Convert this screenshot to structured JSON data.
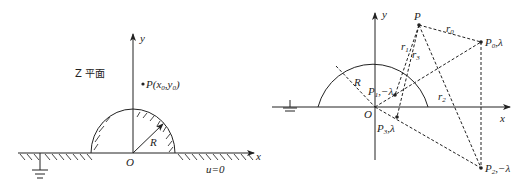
{
  "left_figure": {
    "plane_label": "Z 平面",
    "axis_x": "x",
    "axis_y": "y",
    "origin": "O",
    "radius_label": "R",
    "point_label": "P(x",
    "point_sub_x": "0",
    "point_mid": ",y",
    "point_sub_y": "0",
    "point_close": ")",
    "boundary_label": "u=0"
  },
  "right_figure": {
    "axis_x": "x",
    "axis_y": "y",
    "origin": "O",
    "radius_label": "R",
    "points": [
      {
        "name": "P",
        "sub": "",
        "charge": ""
      },
      {
        "name": "P",
        "sub": "0",
        "charge": ",λ"
      },
      {
        "name": "P",
        "sub": "1",
        "charge": ",−λ"
      },
      {
        "name": "P",
        "sub": "2",
        "charge": ",−λ"
      },
      {
        "name": "P",
        "sub": "3",
        "charge": ",λ"
      }
    ],
    "distances": [
      {
        "name": "r",
        "sub": "0"
      },
      {
        "name": "r",
        "sub": "1"
      },
      {
        "name": "r",
        "sub": "2"
      },
      {
        "name": "r",
        "sub": "3"
      }
    ]
  }
}
